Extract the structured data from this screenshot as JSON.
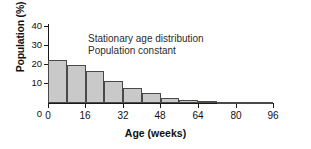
{
  "chart_data": {
    "type": "bar",
    "title": "",
    "xlabel": "Age (weeks)",
    "ylabel": "Population (%)",
    "xlim": [
      0,
      96
    ],
    "ylim": [
      0,
      40
    ],
    "xticks": [
      0,
      16,
      32,
      48,
      64,
      80,
      96
    ],
    "yticks": [
      0,
      10,
      20,
      30,
      40
    ],
    "grid": false,
    "legend": "none",
    "bin_width": 8,
    "categories": [
      "0-8",
      "8-16",
      "16-24",
      "24-32",
      "32-40",
      "40-48",
      "48-56",
      "56-64",
      "64-72",
      "72-80",
      "80-88",
      "88-96"
    ],
    "x": [
      0,
      8,
      16,
      24,
      32,
      40,
      48,
      56,
      64,
      72,
      80,
      88
    ],
    "values": [
      22.5,
      20,
      16.5,
      11.5,
      8,
      5,
      2.5,
      1.5,
      1,
      0.7,
      0.4,
      0.2
    ],
    "annotations": [
      "Stationary age distribution",
      "Population constant"
    ],
    "bar_fill": "#c9c9c9",
    "bar_stroke": "#4a4a4a",
    "axis_color": "#1a1a1a",
    "background": "#ffffff"
  },
  "axes": {
    "y": {
      "title": "Population (%)",
      "tick_labels": [
        "40",
        "30",
        "20",
        "10",
        "0"
      ]
    },
    "x": {
      "title": "Age (weeks)",
      "tick_labels": [
        "0",
        "16",
        "32",
        "48",
        "64",
        "80",
        "96"
      ]
    }
  },
  "annotation": {
    "line1": "Stationary age distribution",
    "line2": "Population constant"
  }
}
